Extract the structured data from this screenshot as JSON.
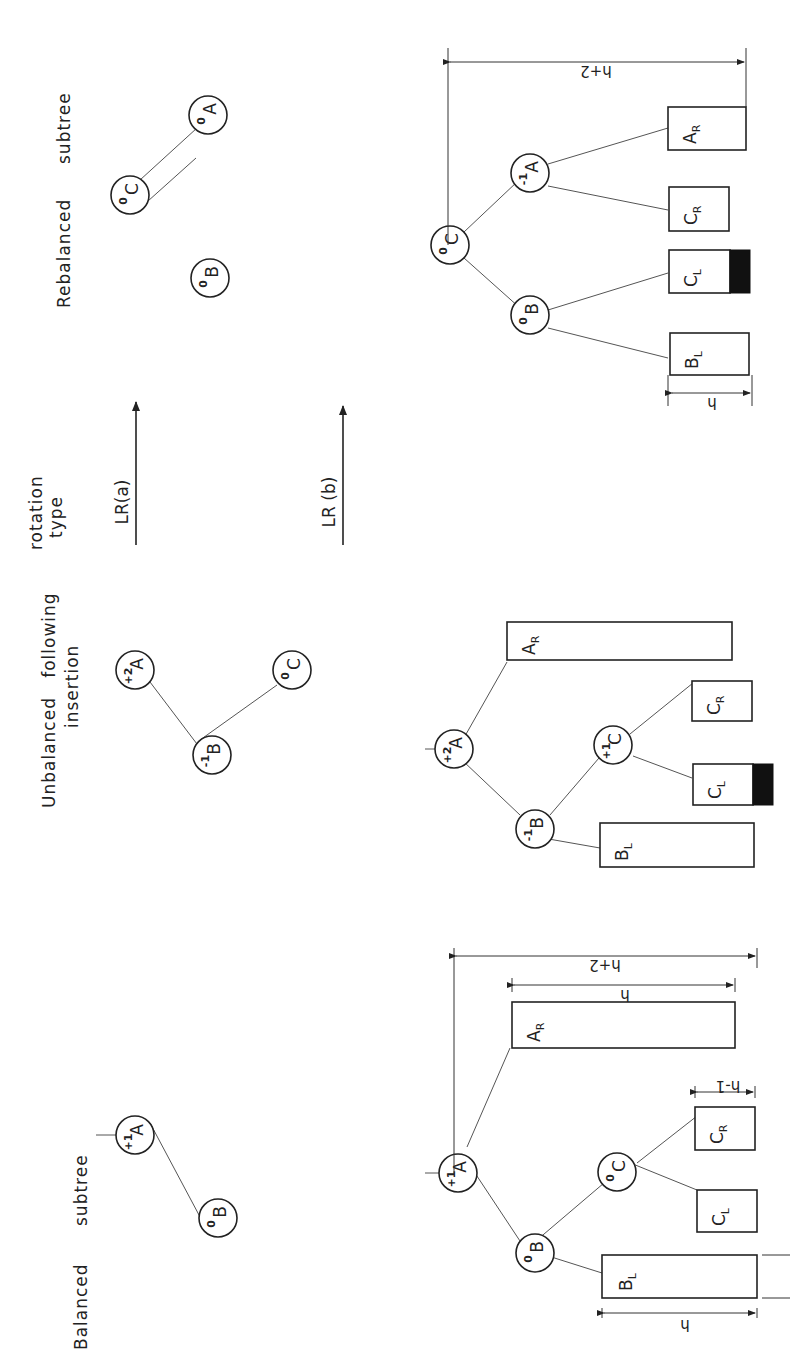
{
  "columns": [
    {
      "heading_line1": "Balanced",
      "heading_line2": "subtree"
    },
    {
      "heading_line1": "Unbalanced   following",
      "heading_line2": "insertion"
    },
    {
      "heading_line1": "rotation",
      "heading_line2": "type"
    },
    {
      "heading_line1": "Rebalanced",
      "heading_line2": "subtree"
    }
  ],
  "rotations": [
    {
      "label": "LR(a)"
    },
    {
      "label": "LR (b)"
    }
  ],
  "panels": {
    "balanced_simple": {
      "nodes": [
        {
          "name": "A",
          "bf": "+1"
        },
        {
          "name": "B",
          "bf": "0"
        }
      ]
    },
    "balanced_general": {
      "nodes": [
        {
          "name": "A",
          "bf": "+1"
        },
        {
          "name": "B",
          "bf": "0"
        },
        {
          "name": "C",
          "bf": "0"
        }
      ],
      "subtrees": [
        {
          "main": "B",
          "sub": "L"
        },
        {
          "main": "C",
          "sub": "L"
        },
        {
          "main": "C",
          "sub": "R"
        },
        {
          "main": "A",
          "sub": "R"
        }
      ],
      "dims": {
        "total": "h+2",
        "ar": "h",
        "cr": "h-1",
        "bl": "h"
      }
    },
    "unbalanced_simple": {
      "nodes": [
        {
          "name": "A",
          "bf": "+2"
        },
        {
          "name": "B",
          "bf": "-1"
        },
        {
          "name": "C",
          "bf": "0"
        }
      ]
    },
    "unbalanced_general": {
      "nodes": [
        {
          "name": "A",
          "bf": "+2"
        },
        {
          "name": "B",
          "bf": "-1"
        },
        {
          "name": "C",
          "bf": "+1"
        }
      ],
      "subtrees": [
        {
          "main": "B",
          "sub": "L"
        },
        {
          "main": "C",
          "sub": "L"
        },
        {
          "main": "C",
          "sub": "R"
        },
        {
          "main": "A",
          "sub": "R"
        }
      ]
    },
    "rebalanced_simple": {
      "nodes": [
        {
          "name": "C",
          "bf": "0"
        },
        {
          "name": "A",
          "bf": "0"
        },
        {
          "name": "B",
          "bf": "0"
        }
      ]
    },
    "rebalanced_general": {
      "nodes": [
        {
          "name": "C",
          "bf": "0"
        },
        {
          "name": "B",
          "bf": "0"
        },
        {
          "name": "A",
          "bf": "-1"
        }
      ],
      "subtrees": [
        {
          "main": "B",
          "sub": "L"
        },
        {
          "main": "C",
          "sub": "L"
        },
        {
          "main": "C",
          "sub": "R"
        },
        {
          "main": "A",
          "sub": "R"
        }
      ],
      "dims": {
        "total": "h+2",
        "bl": "h"
      }
    }
  }
}
